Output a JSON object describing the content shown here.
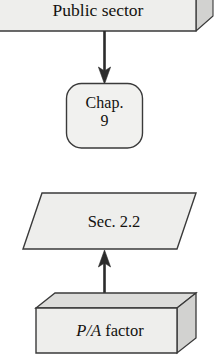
{
  "diagram": {
    "type": "flowchart",
    "canvas": {
      "width": 219,
      "height": 362,
      "background": "#ffffff"
    },
    "palette": {
      "face_fill": "#eeeeec",
      "top_fill": "#dcdcda",
      "side_fill": "#d2d2d0",
      "stroke": "#3a3a3a",
      "text": "#14120f",
      "arrow": "#2b2b2b"
    },
    "nodes": [
      {
        "id": "public-sector",
        "shape": "cuboid",
        "label": "Public sector",
        "cropped": true
      },
      {
        "id": "chap-9",
        "shape": "rounded-rectangle",
        "label_line_1": "Chap.",
        "label_line_2": "9"
      },
      {
        "id": "sec-2-2",
        "shape": "parallelogram",
        "label": "Sec. 2.2"
      },
      {
        "id": "pa-factor",
        "shape": "cuboid",
        "label_italic": "P/A",
        "label_plain": " factor"
      }
    ],
    "edges": [
      {
        "id": "edge-public-to-chap",
        "from": "public-sector",
        "to": "chap-9",
        "direction": "down"
      },
      {
        "id": "edge-pa-to-sec",
        "from": "pa-factor",
        "to": "sec-2-2",
        "direction": "up"
      }
    ]
  }
}
